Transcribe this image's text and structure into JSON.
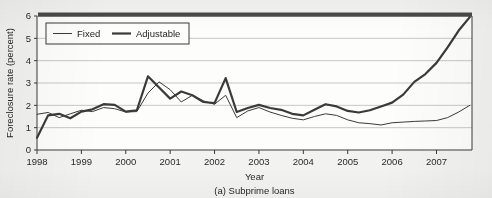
{
  "figure": {
    "caption": "(a) Subprime loans",
    "background_color": "#f2f2f0"
  },
  "chart_data": {
    "type": "line",
    "title": "",
    "subtitle": "",
    "caption": "(a) Subprime loans",
    "xlabel": "Year",
    "ylabel": "Foreclosure rate (percent)",
    "xlim": [
      1998.0,
      2007.8
    ],
    "ylim": [
      0,
      6
    ],
    "yticks": [
      0,
      1,
      2,
      3,
      4,
      5,
      6
    ],
    "ytick_labels": [
      "0",
      "1",
      "2",
      "3",
      "4",
      "5",
      "6"
    ],
    "xticks": [
      1998,
      1999,
      2000,
      2001,
      2002,
      2003,
      2004,
      2005,
      2006,
      2007
    ],
    "xtick_labels": [
      "1998",
      "1999",
      "2000",
      "2001",
      "2002",
      "2003",
      "2004",
      "2005",
      "2006",
      "2007"
    ],
    "grid": true,
    "grid_axis": "y",
    "grid_color": "#b9b9b9",
    "legend_position": "upper-left",
    "legend_entries": [
      "Fixed",
      "Adjustable"
    ],
    "line_color": "#3a3a3a",
    "x": [
      1998.0,
      1998.25,
      1998.5,
      1998.75,
      1999.0,
      1999.25,
      1999.5,
      1999.75,
      2000.0,
      2000.25,
      2000.5,
      2000.75,
      2001.0,
      2001.25,
      2001.5,
      2001.75,
      2002.0,
      2002.25,
      2002.5,
      2002.75,
      2003.0,
      2003.25,
      2003.5,
      2003.75,
      2004.0,
      2004.25,
      2004.5,
      2004.75,
      2005.0,
      2005.25,
      2005.5,
      2005.75,
      2006.0,
      2006.25,
      2006.5,
      2006.75,
      2007.0,
      2007.25,
      2007.5,
      2007.75
    ],
    "series": [
      {
        "name": "Fixed",
        "line_width": 1.0,
        "values": [
          1.6,
          1.68,
          1.45,
          1.62,
          1.78,
          1.72,
          1.9,
          1.85,
          1.7,
          1.72,
          2.55,
          3.05,
          2.7,
          2.15,
          2.45,
          2.2,
          2.05,
          2.45,
          1.45,
          1.75,
          1.9,
          1.7,
          1.55,
          1.42,
          1.35,
          1.5,
          1.62,
          1.55,
          1.35,
          1.22,
          1.18,
          1.12,
          1.22,
          1.25,
          1.28,
          1.3,
          1.32,
          1.45,
          1.7,
          2.0
        ]
      },
      {
        "name": "Adjustable",
        "line_width": 2.2,
        "values": [
          0.55,
          1.55,
          1.62,
          1.42,
          1.72,
          1.82,
          2.05,
          2.02,
          1.72,
          1.78,
          3.3,
          2.8,
          2.3,
          2.62,
          2.45,
          2.15,
          2.1,
          3.22,
          1.7,
          1.88,
          2.02,
          1.88,
          1.8,
          1.62,
          1.55,
          1.8,
          2.05,
          1.95,
          1.75,
          1.68,
          1.78,
          1.95,
          2.12,
          2.48,
          3.05,
          3.4,
          3.9,
          4.6,
          5.35,
          5.95
        ]
      }
    ]
  },
  "top_band": {
    "color": "#4a4a4a"
  }
}
